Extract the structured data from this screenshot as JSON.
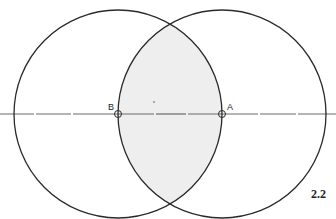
{
  "figure": {
    "number": "2.2",
    "background": "#ffffff",
    "stroke_color": "#2a2a2a",
    "line_color": "#6a6a6a",
    "lens_fill": "#eeeeee"
  },
  "points": [
    {
      "id": "B",
      "label": "B",
      "x": 118,
      "y": 114
    },
    {
      "id": "A",
      "label": "A",
      "x": 222,
      "y": 114
    }
  ],
  "circles": [
    {
      "name": "circle-centered-b",
      "cx": 118,
      "cy": 114,
      "r": 104
    },
    {
      "name": "circle-centered-a",
      "cx": 222,
      "cy": 114,
      "r": 104
    }
  ],
  "axis_line": {
    "y": 114,
    "x_start": 0,
    "x_end": 336
  }
}
